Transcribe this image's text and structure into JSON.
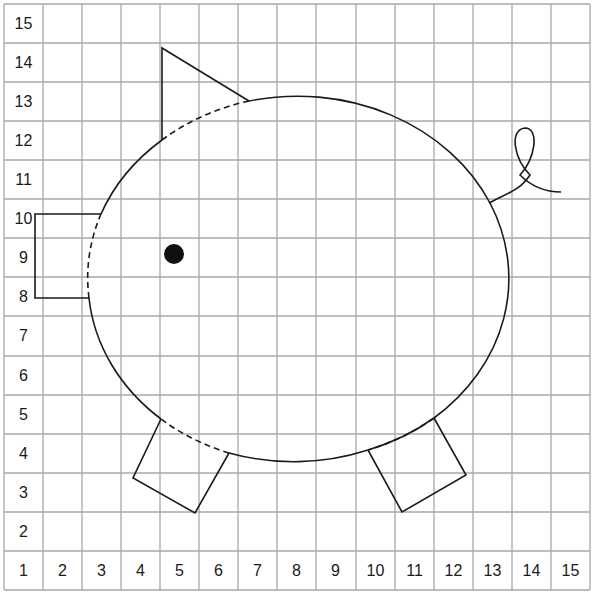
{
  "diagram": {
    "grid": {
      "columns": 15,
      "rows": 15,
      "line_color": "#a8a8a8",
      "stroke_color": "#1a1a1a"
    },
    "row_labels": [
      "15",
      "14",
      "13",
      "12",
      "11",
      "10",
      "9",
      "8",
      "7",
      "6",
      "5",
      "4",
      "3",
      "2",
      "1"
    ],
    "column_labels": [
      "2",
      "3",
      "4",
      "5",
      "6",
      "7",
      "8",
      "9",
      "10",
      "11",
      "12",
      "13",
      "14",
      "15"
    ],
    "shapes": [
      {
        "name": "body",
        "type": "ellipse",
        "note": "solid outline with dashed segments where ear, snout and legs overlap"
      },
      {
        "name": "ear",
        "type": "triangle"
      },
      {
        "name": "snout",
        "type": "rectangle"
      },
      {
        "name": "eye",
        "type": "dot"
      },
      {
        "name": "front-leg",
        "type": "rotated-rectangle"
      },
      {
        "name": "back-leg",
        "type": "rotated-rectangle"
      },
      {
        "name": "tail",
        "type": "curl"
      }
    ]
  }
}
